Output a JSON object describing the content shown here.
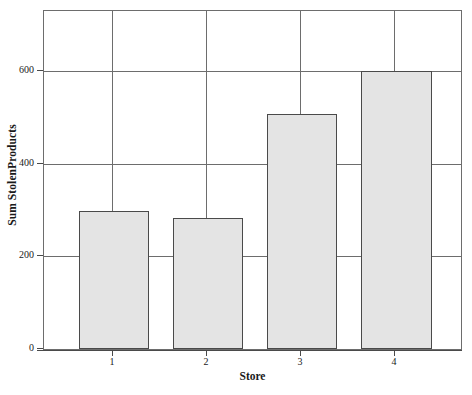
{
  "chart_data": {
    "type": "bar",
    "title": "",
    "xlabel": "Store",
    "ylabel": "Sum StolenProducts",
    "categories": [
      "1",
      "2",
      "3",
      "4"
    ],
    "values": [
      298,
      282,
      508,
      600
    ],
    "xtick_labels": [
      "1",
      "2",
      "3",
      "4"
    ],
    "ytick_labels": [
      "0",
      "200",
      "400",
      "600"
    ],
    "ytick_values": [
      0,
      200,
      400,
      600
    ],
    "ylim": [
      0,
      730
    ],
    "xlim": [
      0.5,
      4.5
    ],
    "grid": "vertical-and-horizontal-at-ticks",
    "legend": "none",
    "bar_fill_color": "#e4e4e4",
    "bar_edge_color": "#4a4a4a",
    "frame_color": "#6d6d6d",
    "background_color": "#ffffff",
    "text_color": "#1a1a1a"
  }
}
